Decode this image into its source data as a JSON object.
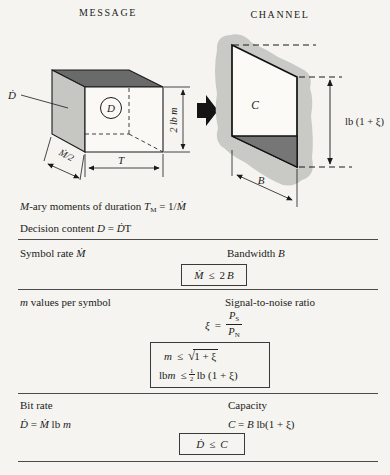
{
  "colors": {
    "background": "#f5f4f0",
    "ink": "#1c1c1c",
    "cube_top_face": "#6a6a6a",
    "cube_left_face": "#c6c6c3",
    "channel_blob": "#c9c9c6",
    "channel_triangle": "#767676"
  },
  "headers": {
    "message": "MESSAGE",
    "channel": "CHANNEL"
  },
  "figure": {
    "message": {
      "ddot_label": "Ḋ",
      "center_label": "D",
      "height_label": "2 lb m",
      "depth_label": "Ṁ/2",
      "width_label": "T"
    },
    "channel": {
      "center_label": "C",
      "height_label": "lb (1 + ξ)",
      "width_label": "B"
    }
  },
  "captions": {
    "mary": {
      "m": "M",
      "text": "-ary moments of duration ",
      "T": "T",
      "Tsub": "M",
      "eq": " = 1/",
      "Mdot": "Ṁ"
    },
    "decision": {
      "text": "Decision content ",
      "D": "D",
      "eq": " = ",
      "Ddot": "Ḋ",
      "T": "T"
    }
  },
  "sections": {
    "symbol_rate": {
      "left": "Symbol rate ",
      "left_var": "Ṁ",
      "right": "Bandwidth ",
      "right_var": "B",
      "box": {
        "lhs": "Ṁ",
        "rel": "≤",
        "coef": "2",
        "rhs": "B"
      }
    },
    "m_values": {
      "left_var": "m",
      "left": " values per symbol",
      "right": "Signal-to-noise ratio",
      "snr": {
        "lhs": "ξ",
        "rel": "=",
        "num": "P",
        "num_sub": "S",
        "den": "P",
        "den_sub": "N"
      },
      "box": {
        "l1_lhs": "m",
        "l1_rel": "≤",
        "l1_sqrt": "√",
        "l1_rad": "1 + ξ",
        "l2_pre": "lb ",
        "l2_lhs": "m",
        "l2_rel": "≤",
        "l2_num": "1",
        "l2_den": "2",
        "l2_post": " lb (1 + ξ)"
      }
    },
    "bit_rate": {
      "left": "Bit rate",
      "right": "Capacity",
      "left_formula": {
        "Ddot": "Ḋ",
        "eq": " = ",
        "Mdot": "Ṁ",
        "lb": " lb ",
        "m": "m"
      },
      "right_formula": {
        "C": "C",
        "eq": " = ",
        "B": "B",
        "rest": " lb(1 + ξ)"
      },
      "box": {
        "lhs": "Ḋ",
        "rel": "≤",
        "rhs": "C"
      }
    }
  }
}
